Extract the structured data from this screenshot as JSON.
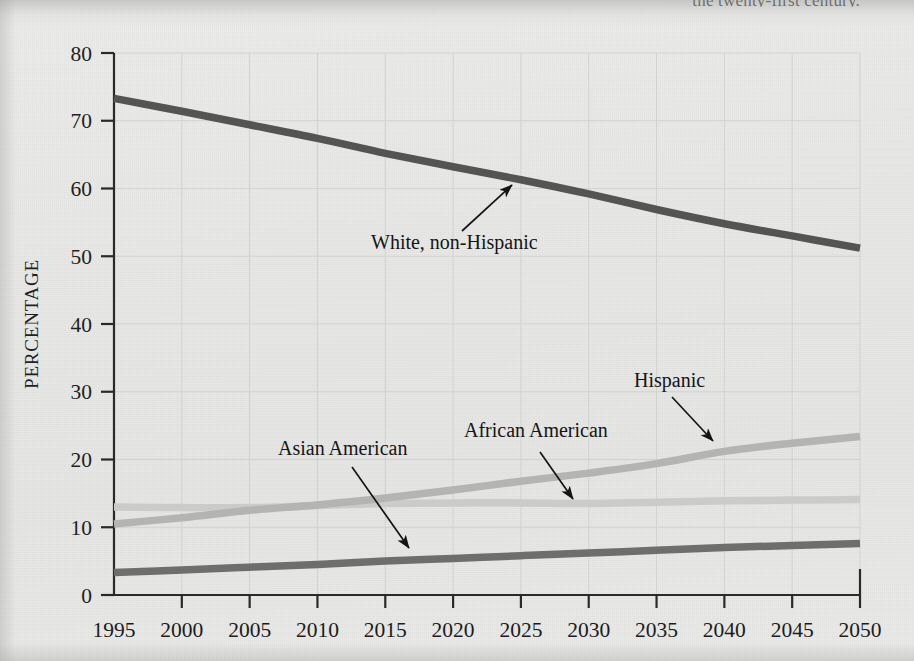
{
  "page": {
    "clipped_running_text": "the twenty-first century."
  },
  "axis": {
    "y_label": "PERCENTAGE",
    "y_ticks": [
      "0",
      "10",
      "20",
      "30",
      "40",
      "50",
      "60",
      "70",
      "80"
    ],
    "x_ticks": [
      "1995",
      "2000",
      "2005",
      "2010",
      "2015",
      "2020",
      "2025",
      "2030",
      "2035",
      "2040",
      "2045",
      "2050"
    ]
  },
  "annotations": {
    "white": "White, non-Hispanic",
    "hispanic": "Hispanic",
    "african_american": "African American",
    "asian_american": "Asian American"
  },
  "colors": {
    "background": "#e8e8e6",
    "axis": "#2a2a2a",
    "grid": "#d2d2d0",
    "white_non_hispanic": "#545454",
    "asian_american": "#6e6e6e",
    "hispanic": "#b4b4b2",
    "african_american": "#cbcbc9",
    "annotation_text": "#151515"
  },
  "chart_data": {
    "type": "line",
    "title": "",
    "xlabel": "",
    "ylabel": "PERCENTAGE",
    "xlim": [
      1995,
      2050
    ],
    "ylim": [
      0,
      80
    ],
    "grid": true,
    "legend": "inline-annotations",
    "x": [
      1995,
      2000,
      2005,
      2010,
      2015,
      2020,
      2025,
      2030,
      2035,
      2040,
      2045,
      2050
    ],
    "series": [
      {
        "name": "White, non-Hispanic",
        "color": "#545454",
        "values": [
          73.3,
          71.4,
          69.4,
          67.4,
          65.2,
          63.2,
          61.3,
          59.2,
          56.9,
          54.8,
          53.0,
          51.2
        ]
      },
      {
        "name": "Hispanic",
        "color": "#b4b4b2",
        "values": [
          10.5,
          11.4,
          12.5,
          13.3,
          14.3,
          15.5,
          16.8,
          18.0,
          19.4,
          21.2,
          22.4,
          23.4
        ]
      },
      {
        "name": "African American",
        "color": "#cbcbc9",
        "values": [
          13.0,
          12.9,
          12.9,
          13.2,
          13.5,
          13.6,
          13.6,
          13.5,
          13.7,
          13.9,
          14.0,
          14.1
        ]
      },
      {
        "name": "Asian American",
        "color": "#6e6e6e",
        "values": [
          3.3,
          3.7,
          4.1,
          4.5,
          5.0,
          5.4,
          5.8,
          6.2,
          6.6,
          7.0,
          7.3,
          7.6
        ]
      }
    ]
  }
}
